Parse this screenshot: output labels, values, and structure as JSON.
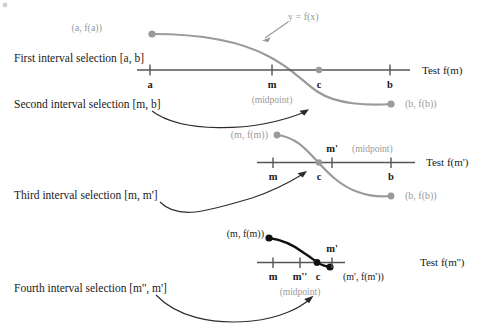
{
  "figure": {
    "type": "diagram",
    "curve_label": "y = f(x)",
    "colors": {
      "curve_gray": "#9a9a9a",
      "curve_black": "#111111",
      "axis": "#555555",
      "text": "#1a1a1a",
      "gray_text": "#9a9a9a",
      "background": "#ffffff"
    }
  },
  "panels": [
    {
      "id": "panel-1",
      "selection_label": "First interval selection [a, b]",
      "test_label": "Test f(m)",
      "midpoint_label": "(midpoint)",
      "curve_label": "y = f(x)",
      "left_point_label": "(a, f(a))",
      "right_point_label": "(b, f(b))",
      "ticks": [
        "a",
        "m",
        "c",
        "b"
      ],
      "root_label": "c"
    },
    {
      "id": "panel-2",
      "selection_label": "Second interval selection [m, b]",
      "test_label": "Test f(m')",
      "midpoint_label": "(midpoint)",
      "left_point_label": "(m, f(m))",
      "right_point_label": "(b, f(b))",
      "ticks": [
        "m",
        "c",
        "m'",
        "b"
      ],
      "above_tick_label": "m'",
      "root_label": "c"
    },
    {
      "id": "panel-3",
      "selection_label": "Third interval selection [m, m']",
      "test_label": "Test f(m'')",
      "midpoint_label": "(midpoint)",
      "left_point_label": "(m, f(m))",
      "right_point_label": "(m', f(m'))",
      "ticks": [
        "m",
        "m''",
        "c",
        "m'"
      ],
      "above_tick_label": "m'",
      "root_label": "c"
    },
    {
      "id": "panel-4",
      "selection_label": "Fourth interval selection [m'', m']"
    }
  ],
  "texts": {
    "first_selection": "First interval selection [a, b]",
    "second_selection": "Second interval selection [m, b]",
    "third_selection": "Third interval selection [m, m']",
    "fourth_selection": "Fourth interval selection [m'', m']",
    "test_fm": "Test f(m)",
    "test_fmp": "Test f(m')",
    "test_fmpp": "Test f(m'')",
    "y_equals_fx": "y = f(x)",
    "midpoint": "(midpoint)",
    "pt_a_fa": "(a, f(a))",
    "pt_b_fb_1": "(b, f(b))",
    "pt_m_fm_1": "(m, f(m))",
    "pt_b_fb_2": "(b, f(b))",
    "pt_m_fm_2": "(m, f(m))",
    "pt_mp_fmp": "(m', f(m'))",
    "tick_a": "a",
    "tick_m_1": "m",
    "tick_c_1": "c",
    "tick_b_1": "b",
    "tick_m_2": "m",
    "tick_c_2": "c",
    "tick_b_2": "b",
    "tick_mp_2": "m'",
    "tick_m_3": "m",
    "tick_mpp_3": "m''",
    "tick_c_3": "c",
    "tick_mp_3": "m'"
  }
}
